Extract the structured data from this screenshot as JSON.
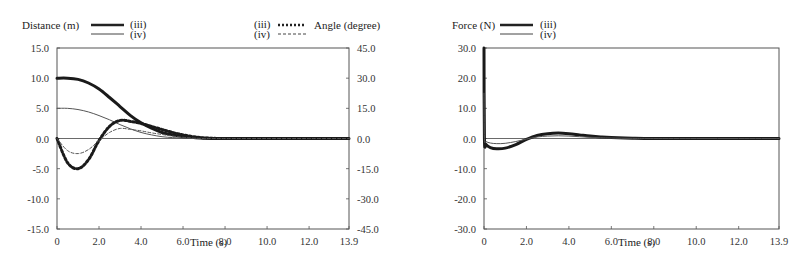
{
  "chart_data": [
    {
      "type": "line",
      "title": "",
      "xlabel": "Time (s)",
      "ylabel": "Distance (m)",
      "ylabel_right": "Angle (degree)",
      "xlim": [
        0,
        13.9
      ],
      "ylim": [
        -15.0,
        15.0
      ],
      "ylim_right": [
        -45.0,
        45.0
      ],
      "x_ticks": [
        "0",
        "2.0",
        "4.0",
        "6.0",
        "8.0",
        "10.0",
        "12.0",
        "13.9"
      ],
      "y_ticks": [
        "15.0",
        "10.0",
        "5.0",
        "0.0",
        "-5.0",
        "-10.0",
        "-15.0"
      ],
      "y_ticks_right": [
        "45.0",
        "30.0",
        "15.0",
        "0.0",
        "-15.0",
        "-30.0",
        "-45.0"
      ],
      "grid": false,
      "legend_left": {
        "label": "Distance (m)",
        "entries": [
          "(iii)",
          "(iv)"
        ]
      },
      "legend_right": {
        "label": "Angle (degree)",
        "entries": [
          "(iii)",
          "(iv)"
        ]
      },
      "x": [
        0,
        0.5,
        1.0,
        1.5,
        2.0,
        2.5,
        3.0,
        3.5,
        4.0,
        4.5,
        5.0,
        5.5,
        6.0,
        6.5,
        7.0,
        8.0,
        10.0,
        12.0,
        13.9
      ],
      "series": [
        {
          "name": "Distance (iii)",
          "axis": "left",
          "style": "thick-solid",
          "values": [
            10.0,
            10.0,
            9.8,
            9.2,
            8.2,
            6.8,
            5.3,
            3.8,
            2.6,
            1.7,
            1.0,
            0.6,
            0.3,
            0.15,
            0.05,
            0.0,
            0.0,
            0.0,
            0.0
          ]
        },
        {
          "name": "Distance (iv)",
          "axis": "left",
          "style": "thin-solid",
          "values": [
            5.0,
            5.0,
            4.8,
            4.4,
            3.8,
            3.1,
            2.3,
            1.6,
            1.0,
            0.6,
            0.3,
            0.15,
            0.05,
            0.0,
            0.0,
            0.0,
            0.0,
            0.0,
            0.0
          ]
        },
        {
          "name": "Angle (iii)",
          "axis": "right",
          "style": "thick-dotted",
          "values": [
            0.0,
            -12.0,
            -15.0,
            -10.5,
            -1.0,
            6.0,
            9.0,
            8.5,
            7.5,
            6.0,
            4.5,
            3.0,
            1.8,
            0.9,
            0.3,
            0.0,
            0.0,
            0.0,
            0.0
          ]
        },
        {
          "name": "Angle (iv)",
          "axis": "right",
          "style": "thin-dashed",
          "values": [
            0.0,
            -6.0,
            -7.5,
            -5.5,
            -1.0,
            3.0,
            5.0,
            4.5,
            3.8,
            2.8,
            2.0,
            1.2,
            0.6,
            0.2,
            0.0,
            0.0,
            0.0,
            0.0,
            0.0
          ]
        }
      ]
    },
    {
      "type": "line",
      "title": "",
      "xlabel": "Time (s)",
      "ylabel": "Force (N)",
      "xlim": [
        0,
        13.9
      ],
      "ylim": [
        -30.0,
        30.0
      ],
      "x_ticks": [
        "0",
        "2.0",
        "4.0",
        "6.0",
        "8.0",
        "10.0",
        "12.0",
        "13.9"
      ],
      "y_ticks": [
        "30.0",
        "20.0",
        "10.0",
        "0.0",
        "-10.0",
        "-20.0",
        "-30.0"
      ],
      "grid": false,
      "legend_left": {
        "label": "Force (N)",
        "entries": [
          "(iii)",
          "(iv)"
        ]
      },
      "x": [
        0,
        0.02,
        0.1,
        0.3,
        0.6,
        1.0,
        1.5,
        2.0,
        2.5,
        3.0,
        3.5,
        4.0,
        4.5,
        5.0,
        5.5,
        6.0,
        7.0,
        8.0,
        10.0,
        12.0,
        13.9
      ],
      "series": [
        {
          "name": "Force (iii)",
          "axis": "left",
          "style": "thick-solid",
          "values": [
            30.0,
            0.0,
            -2.0,
            -3.0,
            -3.4,
            -3.2,
            -2.0,
            -0.3,
            1.0,
            1.6,
            1.8,
            1.6,
            1.2,
            0.8,
            0.5,
            0.3,
            0.1,
            0.0,
            0.0,
            0.0,
            0.0
          ]
        },
        {
          "name": "Force (iv)",
          "axis": "left",
          "style": "thin-solid",
          "values": [
            15.0,
            0.0,
            -1.0,
            -1.5,
            -1.7,
            -1.6,
            -1.0,
            -0.2,
            0.5,
            0.8,
            0.9,
            0.8,
            0.6,
            0.4,
            0.25,
            0.15,
            0.05,
            0.0,
            0.0,
            0.0,
            0.0
          ]
        }
      ]
    }
  ]
}
